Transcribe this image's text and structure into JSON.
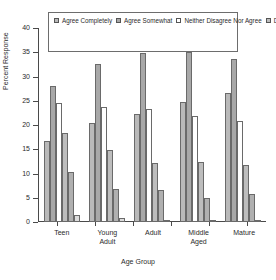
{
  "chart_data": {
    "type": "bar",
    "title": "",
    "xlabel": "Age Group",
    "ylabel": "Percent Response",
    "ylim": [
      0,
      40
    ],
    "yticks": [
      0,
      5,
      10,
      15,
      20,
      25,
      30,
      35,
      40
    ],
    "grid": false,
    "legend_position": "top-center",
    "categories": [
      "Teen",
      "Young Adult",
      "Adult",
      "Middle Aged",
      "Mature"
    ],
    "category_lines": [
      [
        "Teen",
        ""
      ],
      [
        "Young",
        "Adult"
      ],
      [
        "Adult",
        ""
      ],
      [
        "Middle",
        "Aged"
      ],
      [
        "Mature",
        ""
      ]
    ],
    "series": [
      {
        "name": "Agree Completely",
        "color": "#b9b9b9",
        "values": [
          16.8,
          20.5,
          22.2,
          24.7,
          26.5
        ]
      },
      {
        "name": "Agree Somewhat",
        "color": "#a8a8a8",
        "values": [
          28.1,
          32.5,
          34.8,
          35.1,
          33.7
        ]
      },
      {
        "name": "Neither Disagree Nor Agree",
        "color": "#ffffff",
        "values": [
          24.5,
          23.7,
          23.2,
          21.8,
          20.9
        ]
      },
      {
        "name": "Disagree Somewhat",
        "color": "#bdbdbd",
        "values": [
          18.4,
          14.8,
          12.1,
          12.3,
          11.7
        ]
      },
      {
        "name": "Disagree Completely",
        "color": "#b0b0b0",
        "values": [
          10.3,
          6.9,
          6.6,
          5.0,
          5.7
        ]
      },
      {
        "name": "Don't Know",
        "color": "#dcdcdc",
        "values": [
          1.4,
          0.9,
          0.5,
          0.4,
          0.5
        ]
      }
    ]
  },
  "legend": {
    "items": [
      {
        "label": "Agree Completely",
        "color": "#b9b9b9"
      },
      {
        "label": "Agree Somewhat",
        "color": "#a8a8a8"
      },
      {
        "label": "Neither Disagree Nor Agree",
        "color": "#ffffff"
      },
      {
        "label": "Disagree Somewhat",
        "color": "#bdbdbd"
      },
      {
        "label": "Disagree Completely",
        "color": "#b0b0b0"
      },
      {
        "label": "Don't Know",
        "color": "#dcdcdc"
      }
    ]
  }
}
